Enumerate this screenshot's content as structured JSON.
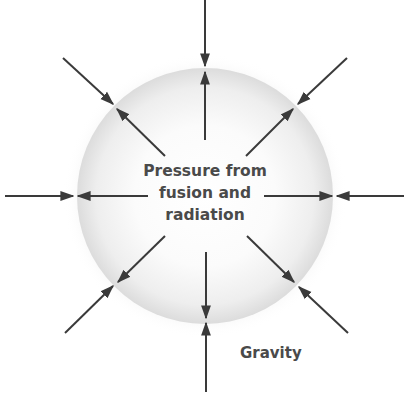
{
  "diagram": {
    "labels": {
      "pressure_line1": "Pressure from",
      "pressure_line2": "fusion and",
      "pressure_line3": "radiation",
      "gravity": "Gravity"
    },
    "colors": {
      "arrow": "#3a3a3a",
      "text": "#4a4a4a",
      "sphere_edge": "#d4d4d4",
      "sphere_center": "#ffffff"
    },
    "sphere": {
      "cx": 205,
      "cy": 196,
      "r": 128
    },
    "arrow_directions": [
      "up",
      "upper-right",
      "right",
      "lower-right",
      "down",
      "lower-left",
      "left",
      "upper-left"
    ]
  }
}
